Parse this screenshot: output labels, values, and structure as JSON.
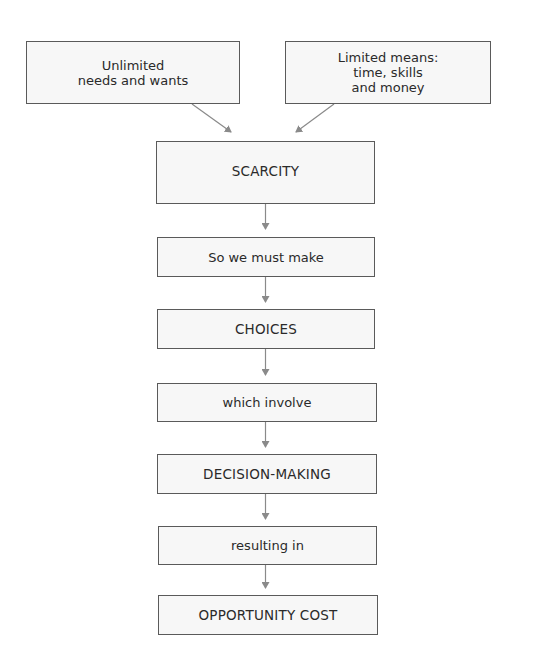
{
  "diagram": {
    "title": "",
    "nodes": [
      {
        "id": "needs",
        "label": "Unlimited\nneeds and wants"
      },
      {
        "id": "means",
        "label": "Limited means:\ntime, skills\nand money"
      },
      {
        "id": "scarcity",
        "label": "SCARCITY"
      },
      {
        "id": "must_make",
        "label": "So we must make"
      },
      {
        "id": "choices",
        "label": "CHOICES"
      },
      {
        "id": "involve",
        "label": "which involve"
      },
      {
        "id": "decision",
        "label": "DECISION-MAKING"
      },
      {
        "id": "resulting",
        "label": "resulting in"
      },
      {
        "id": "opportunity",
        "label": "OPPORTUNITY COST"
      }
    ],
    "edges": [
      {
        "from": "needs",
        "to": "scarcity"
      },
      {
        "from": "means",
        "to": "scarcity"
      },
      {
        "from": "scarcity",
        "to": "must_make"
      },
      {
        "from": "must_make",
        "to": "choices"
      },
      {
        "from": "choices",
        "to": "involve"
      },
      {
        "from": "involve",
        "to": "decision"
      },
      {
        "from": "decision",
        "to": "resulting"
      },
      {
        "from": "resulting",
        "to": "opportunity"
      }
    ],
    "colors": {
      "border": "#5a5a5a",
      "fill": "#f7f7f7",
      "arrow": "#8a8a8a",
      "text": "#2a2a2a"
    }
  }
}
